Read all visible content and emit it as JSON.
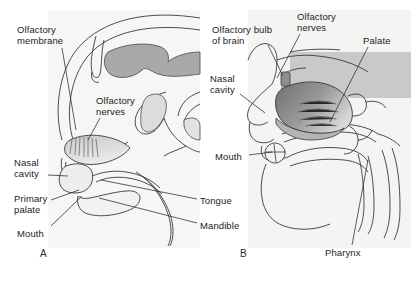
{
  "figure": {
    "type": "anatomical-diagram",
    "background_color": "#ffffff",
    "line_color": "#3a3a3a",
    "text_color": "#1d1d1d",
    "panels": [
      {
        "letter": "A",
        "letter_x": 40,
        "letter_y": 248,
        "description": "Fetal / infant midsagittal section showing developing nasal cavity and primary palate",
        "tint_color": "#f4f4f2",
        "labels": [
          {
            "id": "olfactory-membrane",
            "text": "Olfactory\nmembrane",
            "x": 17,
            "y": 25,
            "leader": [
              [
                62,
                48
              ],
              [
                76,
                130
              ]
            ]
          },
          {
            "id": "olfactory-nerves",
            "text": "Olfactory\nnerves",
            "x": 96,
            "y": 96,
            "leader": [
              [
                100,
                118
              ],
              [
                88,
                140
              ]
            ]
          },
          {
            "id": "nasal-cavity",
            "text": "Nasal\ncavity",
            "x": 14,
            "y": 158,
            "leader": [
              [
                48,
                175
              ],
              [
                68,
                176
              ]
            ]
          },
          {
            "id": "primary-palate",
            "text": "Primary\npalate",
            "x": 14,
            "y": 194,
            "leader": [
              [
                51,
                200
              ],
              [
                79,
                190
              ]
            ]
          },
          {
            "id": "mouth",
            "text": "Mouth",
            "x": 17,
            "y": 229,
            "leader": [
              [
                51,
                226
              ],
              [
                82,
                196
              ]
            ]
          },
          {
            "id": "tongue",
            "text": "Tongue",
            "x": 200,
            "y": 196,
            "leader": [
              [
                197,
                199
              ],
              [
                101,
                180
              ]
            ]
          },
          {
            "id": "mandible",
            "text": "Mandible",
            "x": 200,
            "y": 221,
            "leader": [
              [
                197,
                223
              ],
              [
                99,
                198
              ]
            ]
          }
        ]
      },
      {
        "letter": "B",
        "letter_x": 240,
        "letter_y": 248,
        "description": "Adult midsagittal section showing olfactory bulb, nasal cavity with turbinates, palate and pharynx",
        "tint_color": "#f2f2f0",
        "labels": [
          {
            "id": "olfactory-bulb-of-brain",
            "text": "Olfactory bulb\nof brain",
            "x": 212,
            "y": 25,
            "leader": [
              [
                268,
                45
              ],
              [
                283,
                76
              ]
            ]
          },
          {
            "id": "olfactory-nerves-b",
            "text": "Olfactory\nnerves",
            "x": 297,
            "y": 12,
            "leader": [
              [
                300,
                34
              ],
              [
                277,
                78
              ]
            ]
          },
          {
            "id": "palate",
            "text": "Palate",
            "x": 363,
            "y": 36,
            "leader": [
              [
                368,
                47
              ],
              [
                330,
                122
              ]
            ]
          },
          {
            "id": "nasal-cavity-b",
            "text": "Nasal\ncavity",
            "x": 210,
            "y": 74,
            "leader": [
              [
                240,
                94
              ],
              [
                265,
                113
              ]
            ]
          },
          {
            "id": "mouth-b",
            "text": "Mouth",
            "x": 215,
            "y": 152,
            "leader": [
              [
                249,
                155
              ],
              [
                272,
                152
              ]
            ]
          },
          {
            "id": "pharynx",
            "text": "Pharynx",
            "x": 325,
            "y": 248,
            "leader": [
              [
                352,
                245
              ],
              [
                368,
                160
              ]
            ]
          }
        ]
      }
    ]
  }
}
